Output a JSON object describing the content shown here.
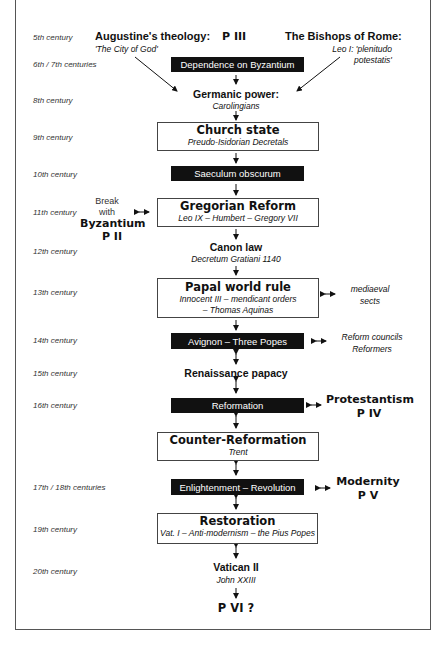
{
  "centuries": [
    {
      "label": "5th century",
      "y": 33
    },
    {
      "label": "6th / 7th centuries",
      "y": 60
    },
    {
      "label": "8th century",
      "y": 96
    },
    {
      "label": "9th century",
      "y": 133
    },
    {
      "label": "10th century",
      "y": 170
    },
    {
      "label": "11th century",
      "y": 208
    },
    {
      "label": "12th century",
      "y": 247
    },
    {
      "label": "13th century",
      "y": 288
    },
    {
      "label": "14th century",
      "y": 336
    },
    {
      "label": "15th century",
      "y": 369
    },
    {
      "label": "16th century",
      "y": 401
    },
    {
      "label": "17th / 18th centuries",
      "y": 483
    },
    {
      "label": "19th century",
      "y": 525
    },
    {
      "label": "20th century",
      "y": 567
    }
  ],
  "top": {
    "augustine_title": "Augustine's theology:",
    "augustine_sub": "'The City of God'",
    "p3": "P III",
    "bishops_title": "The Bishops of Rome:",
    "bishops_sub1": "Leo I: 'plenitudo",
    "bishops_sub2": "potestatis'"
  },
  "nodes": {
    "byzantium_dependence": "Dependence on Byzantium",
    "germanic_title": "Germanic power:",
    "germanic_sub": "Carolingians",
    "church_state_title": "Church state",
    "church_state_sub": "Preudo-Isidorian Decretals",
    "saeculum": "Saeculum obscurum",
    "gregorian_title": "Gregorian Reform",
    "gregorian_sub": "Leo IX – Humbert – Gregory VII",
    "canon_title": "Canon law",
    "canon_sub": "Decretum Gratiani 1140",
    "papal_title": "Papal world rule",
    "papal_sub1": "Innocent III – mendicant orders",
    "papal_sub2": "– Thomas Aquinas",
    "avignon": "Avignon – Three Popes",
    "renaissance": "Renaissance papacy",
    "reformation": "Reformation",
    "counter_title": "Counter-Reformation",
    "counter_sub": "Trent",
    "enlightenment": "Enlightenment – Revolution",
    "restoration_title": "Restoration",
    "restoration_sub": "Vat. I – Anti-modernism – the Pius Popes",
    "vatican_title": "Vatican II",
    "vatican_sub": "John XXIII",
    "p6": "P VI ?"
  },
  "side": {
    "break_1": "Break",
    "break_2": "with",
    "break_3": "Byzantium",
    "break_4": "P II",
    "sects_1": "mediaeval",
    "sects_2": "sects",
    "councils_1": "Reform councils",
    "councils_2": "Reformers",
    "protestantism_1": "Protestantism",
    "protestantism_2": "P IV",
    "modernity_1": "Modernity",
    "modernity_2": "P V"
  }
}
